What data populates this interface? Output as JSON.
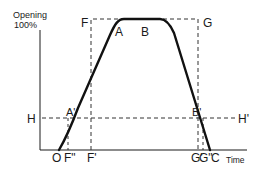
{
  "diagram": {
    "y_axis": {
      "label_line1": "Opening",
      "label_line2": "100%"
    },
    "x_axis": {
      "label": "Time"
    },
    "points": {
      "A": "A",
      "B": "B",
      "A_prime": "A'",
      "B_prime": "B'",
      "F": "F",
      "G": "G",
      "H": "H",
      "H_prime": "H'",
      "O": "O",
      "F_double_prime": "F\"",
      "F_prime": "F'",
      "G_prime": "G'",
      "G_double_prime": "G\"",
      "C": "C"
    },
    "colors": {
      "ink": "#1a1a1a",
      "background": "#ffffff"
    }
  }
}
